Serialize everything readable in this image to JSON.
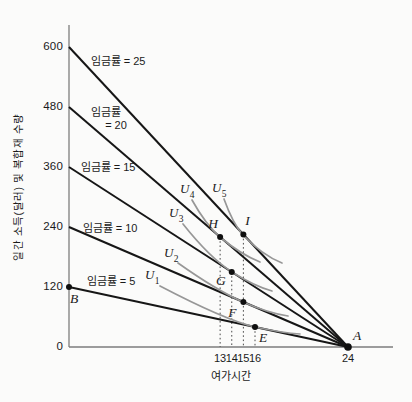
{
  "chart_data": {
    "type": "line",
    "title": "",
    "xlabel": "여가시간",
    "ylabel": "일간 소득(달러) 및 복합재 수량",
    "xlim": [
      0,
      27.8
    ],
    "ylim": [
      0,
      645
    ],
    "x_ticks": [
      13,
      14,
      15,
      16,
      24
    ],
    "y_ticks": [
      0,
      120,
      240,
      360,
      480,
      600
    ],
    "grid": false,
    "legend": "none",
    "colors": {
      "budget_line": "#161616",
      "indifference_curve": "#979797",
      "axis": "#7d7d7d",
      "dropline": "#4a4a4a",
      "point": "#0f0f0f",
      "text": "#1a1a1a",
      "paper": "#fbfbfa"
    },
    "budget_lines": [
      {
        "wage": 5,
        "label": "임금률 = 5",
        "intercept_income": 120,
        "end_point": [
          24,
          0
        ],
        "label_xy": [
          111,
          281
        ]
      },
      {
        "wage": 10,
        "label": "임금률 = 10",
        "intercept_income": 240,
        "end_point": [
          24,
          0
        ],
        "label_xy": [
          110,
          228
        ]
      },
      {
        "wage": 15,
        "label": "임금률 = 15",
        "intercept_income": 360,
        "end_point": [
          24,
          0
        ],
        "label_xy": [
          108,
          167
        ]
      },
      {
        "wage": 20,
        "label_line1": "임금률",
        "label_line2": "= 20",
        "intercept_income": 480,
        "end_point": [
          24,
          0
        ],
        "label_xy": [
          109,
          119
        ]
      },
      {
        "wage": 25,
        "label": "임금률 = 25",
        "intercept_income": 600,
        "end_point": [
          24,
          0
        ],
        "label_xy": [
          118,
          61
        ]
      }
    ],
    "points": [
      {
        "name": "A",
        "leisure": 24,
        "income": 0,
        "on_line_wage": null,
        "label_dx": 9,
        "label_dy": -11,
        "r": 3.8
      },
      {
        "name": "B",
        "leisure": 0,
        "income": 120,
        "on_line_wage": 5,
        "label_dx": 5,
        "label_dy": 12,
        "r": 3
      },
      {
        "name": "E",
        "leisure": 16,
        "income": 40,
        "on_line_wage": 5,
        "label_dx": 8,
        "label_dy": 11,
        "r": 3
      },
      {
        "name": "F",
        "leisure": 15,
        "income": 90,
        "on_line_wage": 10,
        "label_dx": -11,
        "label_dy": 11,
        "r": 3
      },
      {
        "name": "G",
        "leisure": 14,
        "income": 150,
        "on_line_wage": 15,
        "label_dx": -11,
        "label_dy": 9,
        "r": 3
      },
      {
        "name": "H",
        "leisure": 13,
        "income": 220,
        "on_line_wage": 20,
        "label_dx": -7,
        "label_dy": -13,
        "r": 3
      },
      {
        "name": "I",
        "leisure": 15,
        "income": 225,
        "on_line_wage": 25,
        "label_dx": 4,
        "label_dy": -14,
        "r": 3
      }
    ],
    "droplines": [
      {
        "leisure": 13,
        "from_income": 220
      },
      {
        "leisure": 14,
        "from_income": 150
      },
      {
        "leisure": 15,
        "from_income": 225
      },
      {
        "leisure": 16,
        "from_income": 40
      }
    ],
    "indifference_curves": [
      {
        "name": "U",
        "sub": "1",
        "tangent_point": "E",
        "label_xy": [
          152,
          277
        ],
        "path_px": [
          [
            160,
            286
          ],
          [
            225,
            320
          ],
          [
            255,
            327
          ],
          [
            283,
            333
          ],
          [
            300,
            334
          ]
        ]
      },
      {
        "name": "U",
        "sub": "2",
        "tangent_point": "F",
        "label_xy": [
          171,
          255
        ],
        "path_px": [
          [
            178,
            263
          ],
          [
            216,
            290
          ],
          [
            243,
            302
          ],
          [
            268,
            313
          ],
          [
            288,
            316
          ]
        ]
      },
      {
        "name": "U",
        "sub": "3",
        "tangent_point": "G",
        "label_xy": [
          176,
          215
        ],
        "path_px": [
          [
            183,
            224
          ],
          [
            210,
            258
          ],
          [
            232,
            272
          ],
          [
            254,
            286
          ],
          [
            272,
            291
          ]
        ]
      },
      {
        "name": "U",
        "sub": "4",
        "tangent_point": "H",
        "label_xy": [
          187,
          191
        ],
        "path_px": [
          [
            192,
            200
          ],
          [
            206,
            225
          ],
          [
            220,
            237
          ],
          [
            240,
            254
          ],
          [
            260,
            262
          ]
        ]
      },
      {
        "name": "U",
        "sub": "5",
        "tangent_point": "I",
        "label_xy": [
          219,
          190
        ],
        "path_px": [
          [
            224,
            199
          ],
          [
            233,
            224
          ],
          [
            243,
            235
          ],
          [
            262,
            255
          ],
          [
            282,
            263
          ]
        ]
      }
    ]
  }
}
